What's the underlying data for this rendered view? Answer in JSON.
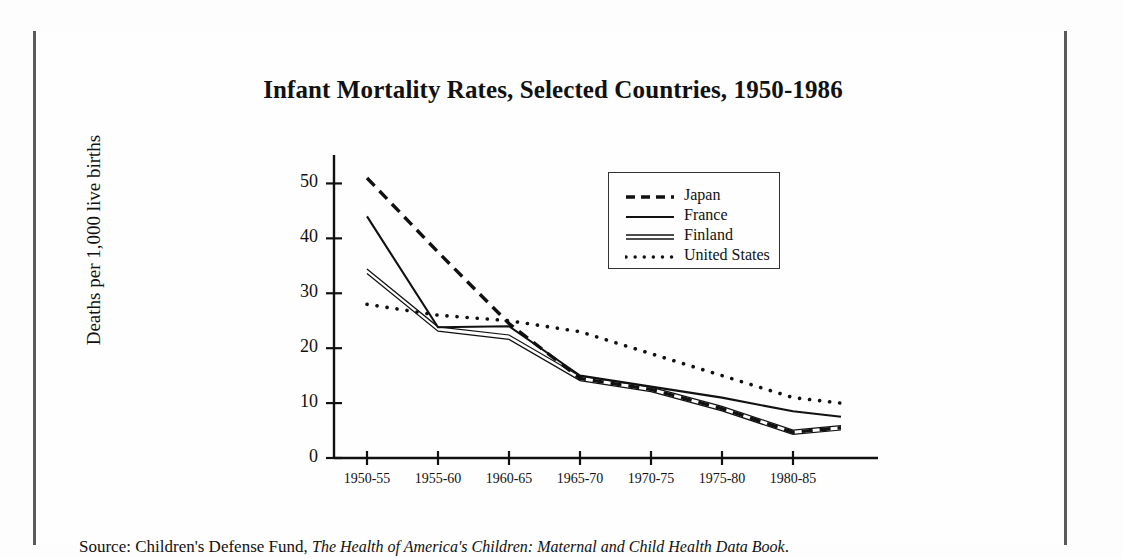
{
  "figure": {
    "title": "Infant Mortality Rates, Selected Countries, 1950-1986",
    "source_prefix": "Source: Children's Defense Fund, ",
    "source_italic": "The Health of America's Children: Maternal and Child Health Data Book",
    "source_suffix": "."
  },
  "chart_data": {
    "type": "line",
    "title": "Infant Mortality Rates, Selected Countries, 1950-1986",
    "xlabel": "",
    "ylabel": "Deaths per 1,000 live births",
    "categories": [
      "1950-55",
      "1955-60",
      "1960-65",
      "1965-70",
      "1970-75",
      "1975-80",
      "1980-85"
    ],
    "ylim": [
      0,
      55
    ],
    "yticks": [
      0,
      10,
      20,
      30,
      40,
      50
    ],
    "ytick_labels": [
      "0",
      "10",
      "20",
      "30",
      "40",
      "50"
    ],
    "grid": false,
    "legend_position": "upper right",
    "note": "Each series has an extra trailing point drawn past the 1980-85 tick, carrying the trend to 1986.",
    "series": [
      {
        "name": "Japan",
        "style": "dashed",
        "color": "#111111",
        "values": [
          51,
          37.5,
          24.5,
          14.5,
          12.5,
          9.0,
          4.7
        ],
        "trailing_value": 5.5
      },
      {
        "name": "France",
        "style": "solid",
        "color": "#111111",
        "values": [
          44,
          23.8,
          24.0,
          15.0,
          13.0,
          11.0,
          8.5
        ],
        "trailing_value": 7.5
      },
      {
        "name": "Finland",
        "style": "double",
        "color": "#111111",
        "values": [
          34,
          23.5,
          22.0,
          14.5,
          12.5,
          9.0,
          4.7
        ],
        "trailing_value": 5.5
      },
      {
        "name": "United States",
        "style": "dotted",
        "color": "#111111",
        "values": [
          28,
          26,
          25,
          23,
          19,
          15,
          11
        ],
        "trailing_value": 10
      }
    ]
  }
}
